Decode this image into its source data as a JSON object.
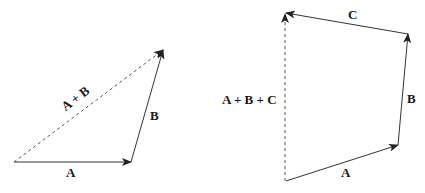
{
  "diagrams": [
    {
      "name": "two-vector-addition",
      "vectors": [
        {
          "label": "A",
          "from": [
            14,
            162
          ],
          "to": [
            131,
            162
          ],
          "style": "solid"
        },
        {
          "label": "B",
          "from": [
            131,
            162
          ],
          "to": [
            163,
            50
          ],
          "style": "solid"
        },
        {
          "label": "A + B",
          "from": [
            14,
            162
          ],
          "to": [
            163,
            50
          ],
          "style": "dashed"
        }
      ]
    },
    {
      "name": "three-vector-addition",
      "vectors": [
        {
          "label": "A",
          "from": [
            286,
            181
          ],
          "to": [
            398,
            145
          ],
          "style": "solid"
        },
        {
          "label": "B",
          "from": [
            398,
            145
          ],
          "to": [
            408,
            34
          ],
          "style": "solid"
        },
        {
          "label": "C",
          "from": [
            408,
            34
          ],
          "to": [
            285,
            13
          ],
          "style": "solid"
        },
        {
          "label": "A + B + C",
          "from": [
            285,
            181
          ],
          "to": [
            285,
            13
          ],
          "style": "dashed"
        }
      ]
    }
  ],
  "labels": {
    "left_a": "A",
    "left_b": "B",
    "left_sum": "A + B",
    "right_a": "A",
    "right_b": "B",
    "right_c": "C",
    "right_sum": "A + B + C"
  },
  "colors": {
    "line": "#333333",
    "text": "#1a1a1a",
    "background": "#ffffff"
  }
}
